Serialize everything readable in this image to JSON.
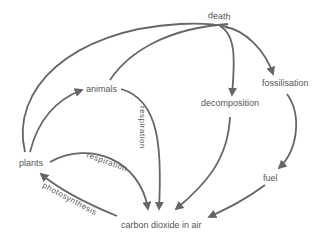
{
  "diagram": {
    "line_color": "#666666",
    "text_color": "#555555",
    "nodes": {
      "death": "death",
      "animals": "animals",
      "decomposition": "decomposition",
      "fossilisation": "fossilisation",
      "plants": "plants",
      "fuel": "fuel",
      "carbon_dioxide": "carbon dioxide in air"
    },
    "edge_labels": {
      "animals_respiration": "respiration",
      "plants_respiration": "respiration",
      "photosynthesis": "photosynthesis"
    },
    "edges": [
      {
        "from": "plants",
        "to": "death"
      },
      {
        "from": "plants",
        "to": "animals"
      },
      {
        "from": "animals",
        "to": "death"
      },
      {
        "from": "death",
        "to": "decomposition"
      },
      {
        "from": "death",
        "to": "fossilisation"
      },
      {
        "from": "fossilisation",
        "to": "fuel"
      },
      {
        "from": "fuel",
        "to": "carbon dioxide in air"
      },
      {
        "from": "decomposition",
        "to": "carbon dioxide in air"
      },
      {
        "from": "animals",
        "to": "carbon dioxide in air",
        "label": "respiration"
      },
      {
        "from": "plants",
        "to": "carbon dioxide in air",
        "label": "respiration"
      },
      {
        "from": "carbon dioxide in air",
        "to": "plants",
        "label": "photosynthesis"
      }
    ]
  }
}
